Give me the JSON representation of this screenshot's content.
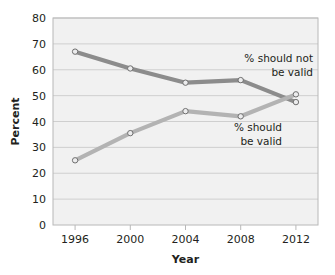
{
  "chart_data": {
    "type": "line",
    "title": "",
    "xlabel": "Year",
    "ylabel": "Percent",
    "categories": [
      "1996",
      "2000",
      "2004",
      "2008",
      "2012"
    ],
    "x": [
      1996,
      2000,
      2004,
      2008,
      2012
    ],
    "xlim": [
      1994.4,
      2013.6
    ],
    "ylim": [
      0,
      80
    ],
    "yticks": [
      "0",
      "10",
      "20",
      "30",
      "40",
      "50",
      "60",
      "70",
      "80"
    ],
    "ytick_values": [
      0,
      10,
      20,
      30,
      40,
      50,
      60,
      70,
      80
    ],
    "grid": "horizontal",
    "legend": "inline-annotations",
    "series": [
      {
        "name": "% should not be valid",
        "color": "#8c8c8c",
        "marker": "open-circle",
        "values": [
          67,
          60.5,
          55,
          56,
          47.5
        ]
      },
      {
        "name": "% should be valid",
        "color": "#b3b3b3",
        "marker": "open-circle",
        "values": [
          25,
          35.5,
          44,
          42,
          50.5
        ]
      }
    ],
    "annotations": [
      {
        "id": "annotation-should-not-be-valid",
        "lines": [
          "% should not",
          "be valid"
        ],
        "series": "% should not be valid"
      },
      {
        "id": "annotation-should-be-valid",
        "lines": [
          "% should",
          "be valid"
        ],
        "series": "% should be valid"
      }
    ],
    "colors": {
      "plot_background": "#f1f1f1",
      "gridline": "#cfcfcf",
      "frame": "#b8b8b8",
      "text": "#231f20",
      "series_dark": "#8c8c8c",
      "series_light": "#b3b3b3",
      "marker_fill": "#ececed"
    }
  }
}
